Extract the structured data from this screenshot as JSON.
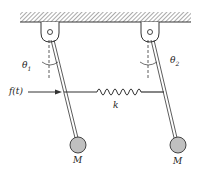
{
  "diagram": {
    "labels": {
      "theta1": "θ",
      "theta1_sub": "1",
      "theta2": "θ",
      "theta2_sub": "2",
      "force": "f(t)",
      "spring": "k",
      "mass_left": "M",
      "mass_right": "M"
    },
    "colors": {
      "line": "#333333",
      "mass_fill": "#c0c0c0",
      "hatch": "#555555"
    }
  }
}
